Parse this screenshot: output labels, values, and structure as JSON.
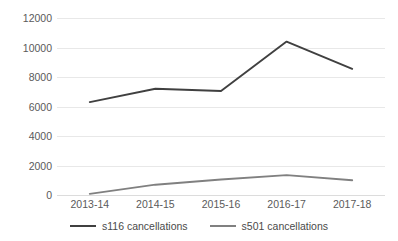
{
  "chart_data": {
    "type": "line",
    "title": "",
    "xlabel": "",
    "ylabel": "",
    "categories": [
      "2013-14",
      "2014-15",
      "2015-16",
      "2016-17",
      "2017-18"
    ],
    "series": [
      {
        "name": "s116 cancellations",
        "color": "#404040",
        "values": [
          6300,
          7200,
          7050,
          10400,
          8550
        ]
      },
      {
        "name": "s501 cancellations",
        "color": "#808080",
        "values": [
          80,
          700,
          1050,
          1350,
          1000
        ]
      }
    ],
    "ylim": [
      0,
      12000
    ],
    "ytick_labels": [
      "0",
      "2000",
      "4000",
      "6000",
      "8000",
      "10000",
      "12000"
    ],
    "ytick_values": [
      0,
      2000,
      4000,
      6000,
      8000,
      10000,
      12000
    ],
    "grid": true,
    "legend_position": "bottom"
  },
  "legend": {
    "entries": [
      {
        "label": "s116 cancellations"
      },
      {
        "label": "s501 cancellations"
      }
    ]
  },
  "colors": {
    "series_s116": "#404040",
    "series_s501": "#808080",
    "gridline": "#e8e8e8",
    "text": "#5a5a5a",
    "background": "#ffffff"
  }
}
